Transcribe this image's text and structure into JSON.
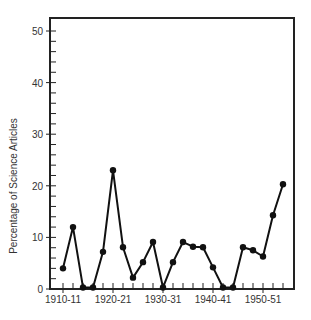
{
  "chart_data": {
    "type": "line",
    "title": "",
    "xlabel": "",
    "ylabel": "Percentage of Science Articles",
    "ylim": [
      0,
      52
    ],
    "yticks": [
      0,
      10,
      20,
      30,
      40,
      50
    ],
    "xtick_labels": [
      "1910-11",
      "1920-21",
      "1930-31",
      "1940-41",
      "1950-51"
    ],
    "grid": false,
    "legend": null,
    "x": [
      "1910-11",
      "1912-13",
      "1914-15",
      "1916-17",
      "1918-19",
      "1920-21",
      "1922-23",
      "1924-25",
      "1926-27",
      "1928-29",
      "1930-31",
      "1932-33",
      "1934-35",
      "1936-37",
      "1938-39",
      "1940-41",
      "1942-43",
      "1944-45",
      "1946-47",
      "1948-49",
      "1950-51",
      "1952-53",
      "1954-55"
    ],
    "series": [
      {
        "name": "Percentage of Science Articles",
        "values": [
          4,
          12,
          0.3,
          0.3,
          7.2,
          23,
          8.1,
          2.2,
          5.2,
          9.1,
          0.3,
          5.2,
          9.1,
          8.2,
          8.1,
          4.2,
          0.3,
          0.3,
          8.1,
          7.5,
          6.3,
          14.3,
          20.3
        ]
      }
    ]
  },
  "axis": {
    "ylabel": "Percentage of Science Articles",
    "ytick_labels": [
      "0",
      "10",
      "20",
      "30",
      "40",
      "50"
    ],
    "xtick_labels": [
      "1910-11",
      "1920-21",
      "1930-31",
      "1940-41",
      "1950-51"
    ]
  }
}
